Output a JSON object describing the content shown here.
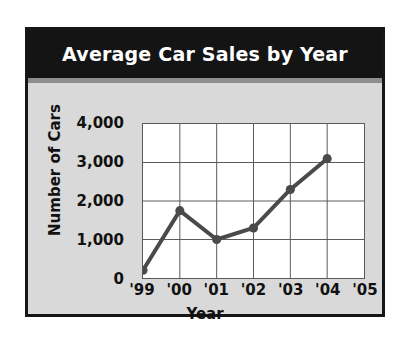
{
  "figure": {
    "title": "Average Car Sales by Year",
    "background_color": "#d9d9d9",
    "banner_color": "#141414",
    "banner_text_color": "#ffffff",
    "border_color": "#161616"
  },
  "chart_data": {
    "type": "line",
    "title": "Average Car Sales by Year",
    "xlabel": "Year",
    "ylabel": "Number of Cars",
    "categories": [
      "'99",
      "'00",
      "'01",
      "'02",
      "'03",
      "'04",
      "'05"
    ],
    "values": [
      200,
      1750,
      1000,
      1300,
      2300,
      3100,
      null
    ],
    "ylim": [
      0,
      4000
    ],
    "ytick_labels": [
      "0",
      "1,000",
      "2,000",
      "3,000",
      "4,000"
    ],
    "ytick_values": [
      0,
      1000,
      2000,
      3000,
      4000
    ],
    "xtick_labels": [
      "'99",
      "'00",
      "'01",
      "'02",
      "'03",
      "'04",
      "'05"
    ],
    "grid": true,
    "legend": "none",
    "line_color": "#4a4a4a",
    "marker_color": "#4a4a4a",
    "plot_background": "#ffffff",
    "grid_color": "#5a5a5a"
  }
}
